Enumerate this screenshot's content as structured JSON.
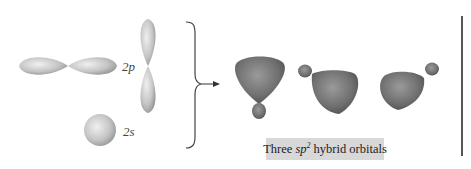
{
  "figure": {
    "left": {
      "p_orbital_label": "2p",
      "s_orbital_label": "2s"
    },
    "right": {
      "caption_prefix": "Three",
      "caption_term": "sp",
      "caption_superscript": "2",
      "caption_suffix": "hybrid orbitals",
      "orbital_count": 3
    },
    "colors": {
      "atomic_orbital_gray": "#b0b0b0",
      "hybrid_orbital_gray": "#7a7a7a",
      "caption_background": "#d8d8d8",
      "text": "#333333"
    }
  }
}
